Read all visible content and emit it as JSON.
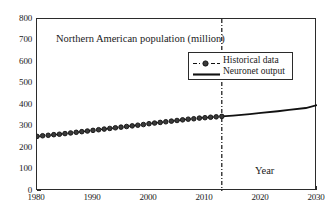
{
  "chart_data": {
    "type": "line",
    "title": "Northern American population (million)",
    "xlabel": "Year",
    "ylabel": "",
    "xlim": [
      1980,
      2030
    ],
    "ylim": [
      0,
      800
    ],
    "grid": false,
    "legend_position": "upper-right",
    "xticks": [
      1980,
      1990,
      2000,
      2010,
      2020,
      2030
    ],
    "yticks": [
      0,
      100,
      200,
      300,
      400,
      500,
      600,
      700,
      800
    ],
    "annotations": [
      {
        "type": "vertical-dashdot-line",
        "x": 2013,
        "label": ""
      }
    ],
    "series": [
      {
        "name": "Historical data",
        "style": "dash-dot-with-circle-markers",
        "color": "#111111",
        "x": [
          1980,
          1981,
          1982,
          1983,
          1984,
          1985,
          1986,
          1987,
          1988,
          1989,
          1990,
          1991,
          1992,
          1993,
          1994,
          1995,
          1996,
          1997,
          1998,
          1999,
          2000,
          2001,
          2002,
          2003,
          2004,
          2005,
          2006,
          2007,
          2008,
          2009,
          2010,
          2011,
          2012,
          2013
        ],
        "values": [
          254,
          257,
          259,
          262,
          264,
          267,
          270,
          273,
          276,
          279,
          282,
          285,
          288,
          291,
          294,
          297,
          300,
          303,
          306,
          309,
          313,
          316,
          319,
          322,
          325,
          328,
          331,
          334,
          336,
          339,
          341,
          343,
          345,
          347
        ]
      },
      {
        "name": "Neuronet output",
        "style": "solid-line",
        "color": "#111111",
        "x": [
          2013,
          2015,
          2018,
          2020,
          2023,
          2025,
          2028,
          2030
        ],
        "values": [
          347,
          351,
          358,
          363,
          371,
          377,
          386,
          400
        ]
      }
    ]
  },
  "chart": {
    "title": "Northern American population (million)",
    "xaxis_caption": "Year",
    "ytick_labels": [
      "800",
      "700",
      "600",
      "500",
      "400",
      "300",
      "200",
      "100",
      "0"
    ],
    "xtick_labels": [
      "1980",
      "1990",
      "2000",
      "2010",
      "2020",
      "2030"
    ],
    "legend": {
      "items": [
        {
          "label": "Historical data",
          "marker": "dashed-circle-marker"
        },
        {
          "label": "Neuronet output",
          "marker": "solid-line"
        }
      ]
    }
  }
}
